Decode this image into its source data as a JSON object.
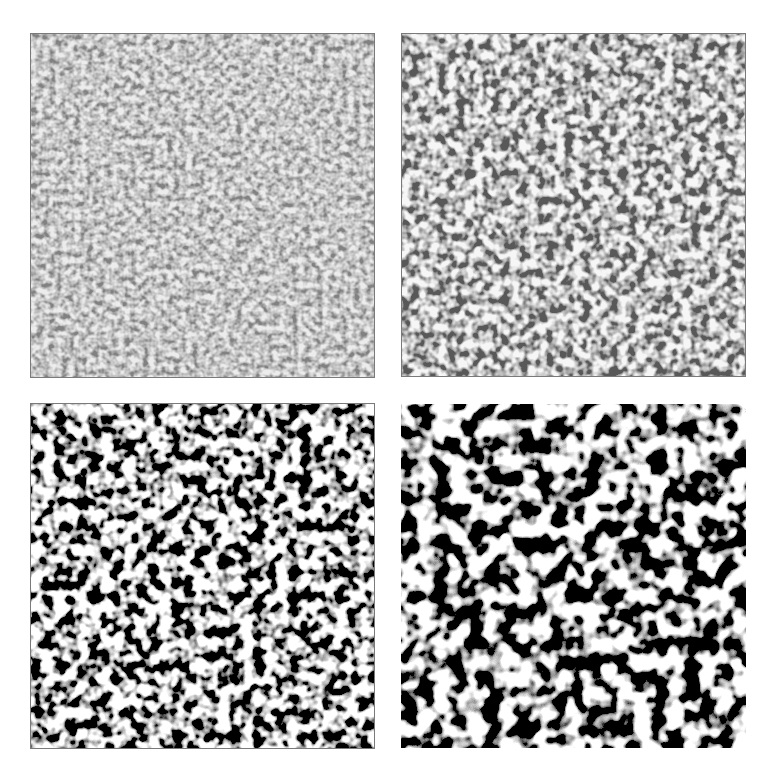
{
  "figure": {
    "layout": "2x2 grid",
    "background": "#ffffff",
    "panels": [
      {
        "id": "top-left",
        "description": "fine-scale labyrinthine pattern, low contrast gray",
        "x": 30,
        "y": 33,
        "w": 344,
        "h": 344,
        "base_frequency": 0.16,
        "contrast": "low",
        "fg": "#3a3a3a",
        "bg": "#d8d8d8",
        "border": true
      },
      {
        "id": "top-right",
        "description": "finer-medium labyrinthine pattern, medium contrast",
        "x": 401,
        "y": 33,
        "w": 344,
        "h": 343,
        "base_frequency": 0.11,
        "contrast": "medium",
        "fg": "#1e1e1e",
        "bg": "#ececec",
        "border": true
      },
      {
        "id": "bottom-left",
        "description": "medium-scale labyrinthine pattern, high contrast",
        "x": 30,
        "y": 404,
        "w": 344,
        "h": 344,
        "base_frequency": 0.085,
        "contrast": "high",
        "fg": "#111111",
        "bg": "#f6f6f6",
        "border": true
      },
      {
        "id": "bottom-right",
        "description": "coarse-scale labyrinthine pattern, high contrast black and white",
        "x": 401,
        "y": 404,
        "w": 344,
        "h": 343,
        "base_frequency": 0.06,
        "contrast": "high",
        "fg": "#0d0d0d",
        "bg": "#ffffff",
        "border": false
      }
    ]
  }
}
